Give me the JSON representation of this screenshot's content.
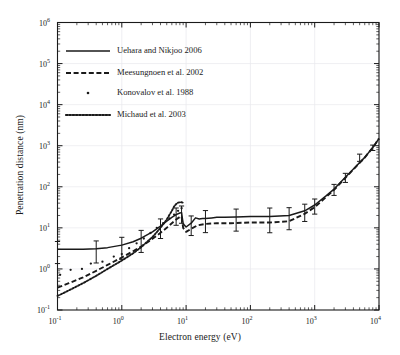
{
  "chart_data": {
    "type": "line",
    "title": "",
    "xlabel": "Electron energy (eV)",
    "ylabel": "Penetration distance (nm)",
    "xscale": "log",
    "yscale": "log",
    "xlim": [
      0.1,
      10000
    ],
    "ylim": [
      0.1,
      1000000
    ],
    "xticks": [
      "10-1",
      "100",
      "101",
      "102",
      "103",
      "104"
    ],
    "yticks": [
      "10-1",
      "100",
      "101",
      "102",
      "103",
      "104",
      "105",
      "106"
    ],
    "grid": true,
    "legend_position": "upper-left-inside",
    "series": [
      {
        "name": "Uehara and Nikjoo 2006",
        "style": "solid",
        "has_error_bars": true,
        "x": [
          0.1,
          0.15,
          0.25,
          0.4,
          0.6,
          1.0,
          1.5,
          2.0,
          3.0,
          4.0,
          5.0,
          6.0,
          7.0,
          8.0,
          8.5,
          9.0,
          10.0,
          12.0,
          14.0,
          16.0,
          18.0,
          20.0,
          25.0,
          30.0,
          40.0,
          60.0,
          100.0,
          200.0,
          400.0,
          700.0,
          1000.0,
          1500.0,
          2000.0,
          3000.0,
          4000.0,
          6000.0,
          8000.0,
          10000.0
        ],
        "y": [
          3.0,
          3.0,
          3.0,
          3.1,
          3.3,
          3.8,
          4.6,
          5.6,
          8.0,
          11.0,
          14.5,
          18.0,
          21.0,
          23.0,
          23.5,
          12.5,
          10.5,
          13.0,
          17.5,
          16.5,
          17.0,
          17.0,
          17.5,
          18.0,
          18.0,
          18.5,
          19.0,
          19.0,
          20.0,
          26.0,
          36.0,
          60.0,
          88.0,
          170.0,
          270.0,
          520.0,
          900.0,
          1500.0
        ],
        "error_bar_x": [
          0.1,
          0.4,
          1.0,
          2.0,
          4.0,
          7.0,
          8.5,
          12.0,
          20.0,
          60.0,
          200.0,
          400.0,
          700.0,
          1000.0,
          2000.0,
          3000.0,
          5000.0,
          8000.0
        ],
        "error_bar_rel": [
          0.55,
          0.55,
          0.55,
          0.55,
          0.5,
          0.45,
          0.45,
          0.5,
          0.55,
          0.55,
          0.6,
          0.55,
          0.45,
          0.4,
          0.3,
          0.25,
          0.2,
          0.15
        ]
      },
      {
        "name": "Meesungnoen et al. 2002",
        "style": "dashed",
        "has_error_bars": false,
        "x": [
          0.1,
          0.15,
          0.25,
          0.4,
          0.6,
          1.0,
          1.5,
          2.0,
          3.0,
          4.0,
          5.0,
          6.0,
          7.0,
          8.0,
          8.5,
          9.0,
          10.0,
          12.0,
          15.0,
          20.0,
          30.0,
          50.0,
          100.0,
          200.0,
          400.0,
          700.0,
          1000.0,
          1500.0,
          2000.0,
          3000.0,
          4000.0,
          6000.0,
          8000.0,
          10000.0
        ],
        "y": [
          0.35,
          0.45,
          0.62,
          0.9,
          1.25,
          1.9,
          2.7,
          3.5,
          5.4,
          7.6,
          10.0,
          13.0,
          16.0,
          18.5,
          19.0,
          10.0,
          8.0,
          9.5,
          11.5,
          12.5,
          13.0,
          13.0,
          13.5,
          13.5,
          14.5,
          22.0,
          32.0,
          56.0,
          84.0,
          165.0,
          265.0,
          515.0,
          895.0,
          1500.0
        ]
      },
      {
        "name": "Konovalov et al. 1988",
        "style": "scatter",
        "has_error_bars": false,
        "x": [
          0.11,
          0.16,
          0.24,
          0.33,
          0.5,
          0.75,
          1.0,
          1.3,
          1.7,
          2.2,
          2.8,
          3.5,
          4.4,
          5.5,
          6.5,
          7.5,
          8.5
        ],
        "y": [
          0.72,
          0.95,
          1.0,
          1.35,
          1.5,
          2.0,
          2.3,
          3.2,
          4.2,
          5.5,
          7.5,
          10.0,
          13.0,
          17.0,
          21.0,
          26.0,
          30.0
        ]
      },
      {
        "name": "Michaud et al. 2003",
        "style": "dotted",
        "has_error_bars": false,
        "x": [
          0.1,
          0.15,
          0.25,
          0.4,
          0.6,
          1.0,
          1.5,
          2.0,
          3.0,
          4.0,
          5.0,
          6.0,
          6.5,
          7.0,
          7.5,
          8.0,
          8.5,
          9.0
        ],
        "y": [
          0.22,
          0.3,
          0.45,
          0.68,
          1.0,
          1.6,
          2.4,
          3.4,
          6.0,
          10.0,
          16.0,
          26.0,
          33.0,
          38.0,
          41.0,
          42.0,
          42.0,
          41.0
        ]
      }
    ]
  },
  "legend": {
    "entries": [
      {
        "label": "Uehara and Nikjoo 2006",
        "marker": "solid-line"
      },
      {
        "label": "Meesungnoen et al. 2002",
        "marker": "dashed-line"
      },
      {
        "label": "Konovalov et al. 1988",
        "marker": "dot-marker"
      },
      {
        "label": "Michaud et al. 2003",
        "marker": "dotted-line"
      }
    ]
  },
  "axes": {
    "x_title": "Electron energy (eV)",
    "y_title": "Penetration distance (nm)",
    "x_tick_mantissa": [
      "10",
      "10",
      "10",
      "10",
      "10",
      "10"
    ],
    "x_tick_exponents": [
      "-1",
      "0",
      "1",
      "2",
      "3",
      "4"
    ],
    "y_tick_mantissa": [
      "10",
      "10",
      "10",
      "10",
      "10",
      "10",
      "10",
      "10"
    ],
    "y_tick_exponents": [
      "-1",
      "0",
      "1",
      "2",
      "3",
      "4",
      "5",
      "6"
    ]
  },
  "colors": {
    "background": "#ffffff",
    "frame": "#1a1a1a",
    "curve": "#1a1a1a",
    "grid": "#e8e8ec"
  }
}
